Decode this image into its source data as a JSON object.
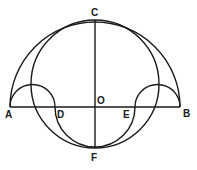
{
  "figure": {
    "type": "geometric construction (salinon)",
    "stroke_color": "#1a1a1a",
    "background": "#ffffff",
    "points": {
      "A": {
        "label": "A",
        "x": 10,
        "y": 107
      },
      "B": {
        "label": "B",
        "x": 180,
        "y": 107
      },
      "C": {
        "label": "C",
        "x": 95,
        "y": 20
      },
      "D": {
        "label": "D",
        "x": 55,
        "y": 107
      },
      "E": {
        "label": "E",
        "x": 135,
        "y": 107
      },
      "F": {
        "label": "F",
        "x": 95,
        "y": 148
      },
      "O": {
        "label": "O",
        "x": 95,
        "y": 107
      }
    },
    "elements": [
      {
        "kind": "segment",
        "from": "A",
        "to": "B"
      },
      {
        "kind": "segment",
        "from": "C",
        "to": "F"
      },
      {
        "kind": "semicircle",
        "diameter": "AB",
        "side": "above"
      },
      {
        "kind": "semicircle",
        "diameter": "AD",
        "side": "above"
      },
      {
        "kind": "semicircle",
        "diameter": "EB",
        "side": "above"
      },
      {
        "kind": "semicircle",
        "diameter": "DE",
        "side": "below"
      },
      {
        "kind": "circle",
        "diameter": "CF"
      }
    ]
  }
}
